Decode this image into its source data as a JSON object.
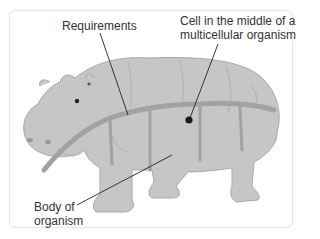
{
  "diagram": {
    "labels": {
      "requirements": "Requirements",
      "cell_line1": "Cell in the middle of a",
      "cell_line2": "multicellular organism",
      "body_line1": "Body of",
      "body_line2": "organism"
    },
    "colors": {
      "hippo_fill": "#c4c4c4",
      "hippo_outline": "#a9a9a9",
      "vessel": "#9e9e9e",
      "leader_line": "#222222",
      "cell_dot": "#1a1a1a",
      "frame_border": "#e6e6e6"
    }
  }
}
